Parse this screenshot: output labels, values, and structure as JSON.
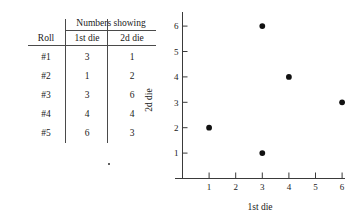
{
  "table": {
    "span_header": "Numbers showing",
    "columns": [
      "Roll",
      "1st die",
      "2d die"
    ],
    "rows": [
      [
        "#1",
        "3",
        "1"
      ],
      [
        "#2",
        "1",
        "2"
      ],
      [
        "#3",
        "3",
        "6"
      ],
      [
        "#4",
        "4",
        "4"
      ],
      [
        "#5",
        "6",
        "3"
      ]
    ]
  },
  "chart_data": {
    "type": "scatter",
    "title": "",
    "xlabel": "1st die",
    "ylabel": "2d die",
    "xticks": [
      "1",
      "2",
      "3",
      "4",
      "5",
      "6"
    ],
    "yticks": [
      "1",
      "2",
      "3",
      "4",
      "5",
      "6"
    ],
    "xlim": [
      0,
      7
    ],
    "ylim": [
      0,
      6.6
    ],
    "grid": false,
    "legend": null,
    "point_color": "#111111",
    "axis_color": "#3a3a3a",
    "points": [
      {
        "label": "#1",
        "x": 3,
        "y": 1
      },
      {
        "label": "#2",
        "x": 1,
        "y": 2
      },
      {
        "label": "#3",
        "x": 3,
        "y": 6
      },
      {
        "label": "#4",
        "x": 4,
        "y": 4
      },
      {
        "label": "#5",
        "x": 6,
        "y": 3
      }
    ]
  }
}
